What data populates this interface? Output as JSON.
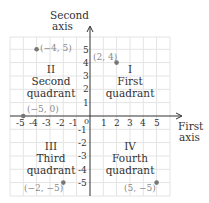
{
  "diagram": {
    "axes": {
      "vertical_label_line1": "Second",
      "vertical_label_line2": "axis",
      "horizontal_label_line1": "First",
      "horizontal_label_line2": "axis",
      "origin_label": "0",
      "x_ticks": [
        "-5",
        "-4",
        "-3",
        "-2",
        "-1",
        "1",
        "2",
        "3",
        "4",
        "5"
      ],
      "y_ticks": [
        "5",
        "4",
        "3",
        "2",
        "1",
        "-1",
        "-2",
        "-3",
        "-4",
        "-5"
      ]
    },
    "quadrants": [
      {
        "numeral": "I",
        "name_line1": "First",
        "name_line2": "quadrant"
      },
      {
        "numeral": "II",
        "name_line1": "Second",
        "name_line2": "quadrant"
      },
      {
        "numeral": "III",
        "name_line1": "Third",
        "name_line2": "quadrant"
      },
      {
        "numeral": "IV",
        "name_line1": "Fourth",
        "name_line2": "quadrant"
      }
    ],
    "points": [
      {
        "label": "(−4, 5)",
        "x": -4,
        "y": 5
      },
      {
        "label": "(2, 4)",
        "x": 2,
        "y": 4
      },
      {
        "label": "(−5, 0)",
        "x": -5,
        "y": 0
      },
      {
        "label": "(−2, −5)",
        "x": -2,
        "y": -5
      },
      {
        "label": "(5, −5)",
        "x": 5,
        "y": -5
      }
    ],
    "colors": {
      "grid": "#e4e4e4",
      "axis": "#333333",
      "point": "#777777",
      "text": "#333333",
      "coord_text": "#8a8a8a"
    }
  }
}
